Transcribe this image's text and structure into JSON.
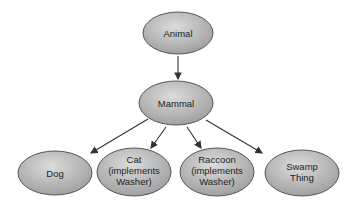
{
  "diagram": {
    "type": "class-hierarchy",
    "colors": {
      "node_fill_light": "#d9d9d9",
      "node_fill_dark": "#9a9a9a",
      "node_stroke": "#555555",
      "arrow": "#333333"
    },
    "nodes": [
      {
        "id": "animal",
        "lines": [
          "Animal"
        ]
      },
      {
        "id": "mammal",
        "lines": [
          "Mammal"
        ]
      },
      {
        "id": "dog",
        "lines": [
          "Dog"
        ]
      },
      {
        "id": "cat",
        "lines": [
          "Cat",
          "(implements",
          "Washer)"
        ]
      },
      {
        "id": "raccoon",
        "lines": [
          "Raccoon",
          "(implements",
          "Washer)"
        ]
      },
      {
        "id": "swamp",
        "lines": [
          "Swamp",
          "Thing"
        ]
      }
    ],
    "edges": [
      {
        "from": "animal",
        "to": "mammal"
      },
      {
        "from": "mammal",
        "to": "dog"
      },
      {
        "from": "mammal",
        "to": "cat"
      },
      {
        "from": "mammal",
        "to": "raccoon"
      },
      {
        "from": "mammal",
        "to": "swamp"
      }
    ]
  }
}
